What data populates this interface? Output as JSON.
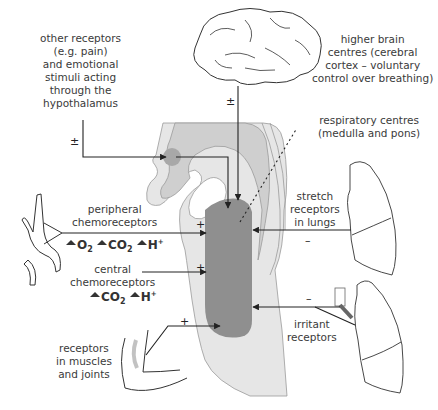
{
  "labels": {
    "other_receptors": [
      "other receptors",
      "(e.g. pain)",
      "and emotional",
      "stimuli acting",
      "through the",
      "hypothalamus"
    ],
    "higher_brain": [
      "higher brain",
      "centres (cerebral",
      "cortex – voluntary",
      "control over breathing)"
    ],
    "respiratory_centres": [
      "respiratory centres",
      "(medulla and pons)"
    ],
    "peripheral": [
      "peripheral",
      "chemoreceptors"
    ],
    "central": [
      "central",
      "chemoreceptors"
    ],
    "stretch": [
      "stretch",
      "receptors",
      "in lungs"
    ],
    "irritant": [
      "irritant",
      "receptors"
    ],
    "muscles": [
      "receptors",
      "in muscles",
      "and joints"
    ]
  },
  "signs": {
    "hypothalamus": "±",
    "brain": "±",
    "peripheral": "+",
    "central": "+",
    "muscles": "+",
    "stretch": "–",
    "irritant": "–"
  },
  "stimuli": {
    "peripheral": [
      {
        "species": "O",
        "sub": "2",
        "sup": ""
      },
      {
        "species": "CO",
        "sub": "2",
        "sup": ""
      },
      {
        "species": "H",
        "sub": "",
        "sup": "+"
      }
    ],
    "central": [
      {
        "species": "CO",
        "sub": "2",
        "sup": ""
      },
      {
        "species": "H",
        "sub": "",
        "sup": "+"
      }
    ]
  },
  "colors": {
    "outer_region": "#e6e6e6",
    "mid_region": "#c9c9c9",
    "respiratory_centre": "#8f8f8f",
    "hypothalamus_spot": "#a8a8a8",
    "line": "#222222"
  }
}
